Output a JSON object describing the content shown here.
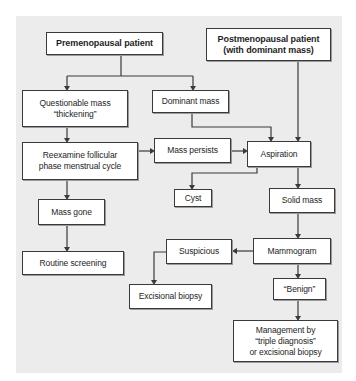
{
  "diagram": {
    "type": "flowchart",
    "nodes": {
      "premenopausal": "Premenopausal patient",
      "postmenopausal": "Postmenopausal patient\n(with dominant mass)",
      "questionable_mass": "Questionable mass\n“thickening”",
      "dominant_mass": "Dominant mass",
      "reexamine": "Reexamine follicular\nphase menstrual cycle",
      "mass_persists": "Mass persists",
      "aspiration": "Aspiration",
      "cyst": "Cyst",
      "solid_mass": "Solid mass",
      "mass_gone": "Mass gone",
      "routine_screening": "Routine screening",
      "suspicious": "Suspicious",
      "mammogram": "Mammogram",
      "excisional_biopsy": "Excisional biopsy",
      "benign": "“Benign”",
      "management": "Management by\n“triple diagnosis”\nor excisional biopsy"
    },
    "edges": [
      {
        "from": "premenopausal",
        "to": "questionable_mass"
      },
      {
        "from": "premenopausal",
        "to": "dominant_mass"
      },
      {
        "from": "postmenopausal",
        "to": "aspiration"
      },
      {
        "from": "questionable_mass",
        "to": "reexamine"
      },
      {
        "from": "dominant_mass",
        "to": "aspiration"
      },
      {
        "from": "reexamine",
        "to": "mass_persists"
      },
      {
        "from": "reexamine",
        "to": "mass_gone"
      },
      {
        "from": "mass_persists",
        "to": "aspiration"
      },
      {
        "from": "aspiration",
        "to": "cyst"
      },
      {
        "from": "aspiration",
        "to": "solid_mass"
      },
      {
        "from": "mass_gone",
        "to": "routine_screening"
      },
      {
        "from": "solid_mass",
        "to": "mammogram"
      },
      {
        "from": "mammogram",
        "to": "suspicious"
      },
      {
        "from": "mammogram",
        "to": "benign"
      },
      {
        "from": "suspicious",
        "to": "excisional_biopsy"
      },
      {
        "from": "benign",
        "to": "management"
      }
    ]
  }
}
